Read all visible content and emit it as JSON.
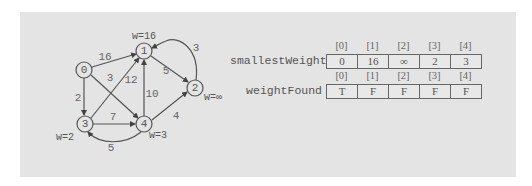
{
  "graph": {
    "nodes": [
      {
        "id": "0",
        "x": 84,
        "y": 70
      },
      {
        "id": "1",
        "x": 144,
        "y": 51
      },
      {
        "id": "2",
        "x": 195,
        "y": 88
      },
      {
        "id": "3",
        "x": 85,
        "y": 124
      },
      {
        "id": "4",
        "x": 144,
        "y": 124
      }
    ],
    "edges": [
      {
        "from": "0",
        "to": "1",
        "weight": "16"
      },
      {
        "from": "0",
        "to": "3",
        "weight": "2"
      },
      {
        "from": "0",
        "to": "4",
        "weight": "3"
      },
      {
        "from": "3",
        "to": "1",
        "weight": "12"
      },
      {
        "from": "3",
        "to": "4",
        "weight": "7"
      },
      {
        "from": "4",
        "to": "1",
        "weight": "10"
      },
      {
        "from": "1",
        "to": "2",
        "weight": "5"
      },
      {
        "from": "2",
        "to": "1",
        "weight": "3"
      },
      {
        "from": "4",
        "to": "2",
        "weight": "4"
      },
      {
        "from": "4",
        "to": "3",
        "weight": "5"
      }
    ],
    "node_weights": {
      "1": "w=16",
      "2": "w=∞",
      "3": "w=2",
      "4": "w=3"
    },
    "labels": {
      "n0": "0",
      "n1": "1",
      "n2": "2",
      "n3": "3",
      "n4": "4",
      "e01": "16",
      "e03": "2",
      "e04": "3",
      "e31": "12",
      "e34": "7",
      "e41": "10",
      "e12": "5",
      "e21": "3",
      "e42": "4",
      "e43": "5",
      "w1": "w=16",
      "w2": "w=∞",
      "w3": "w=2",
      "w4": "w=3"
    }
  },
  "arrays": {
    "smallestWeight": {
      "label": "smallestWeight",
      "indices": [
        "[0]",
        "[1]",
        "[2]",
        "[3]",
        "[4]"
      ],
      "values": [
        "0",
        "16",
        "∞",
        "2",
        "3"
      ]
    },
    "weightFound": {
      "label": "weightFound",
      "indices": [
        "[0]",
        "[1]",
        "[2]",
        "[3]",
        "[4]"
      ],
      "values": [
        "T",
        "F",
        "F",
        "F",
        "F"
      ]
    }
  }
}
